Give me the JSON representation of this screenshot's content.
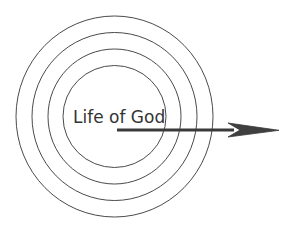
{
  "diagram": {
    "center_label": "Life of God",
    "ring_count": 4,
    "arrow": {
      "direction": "right",
      "meaning": "outward from center"
    },
    "colors": {
      "rings": "#4a4a4a",
      "text": "#333333",
      "arrow": "#3a3a3a",
      "background": "#ffffff"
    }
  }
}
